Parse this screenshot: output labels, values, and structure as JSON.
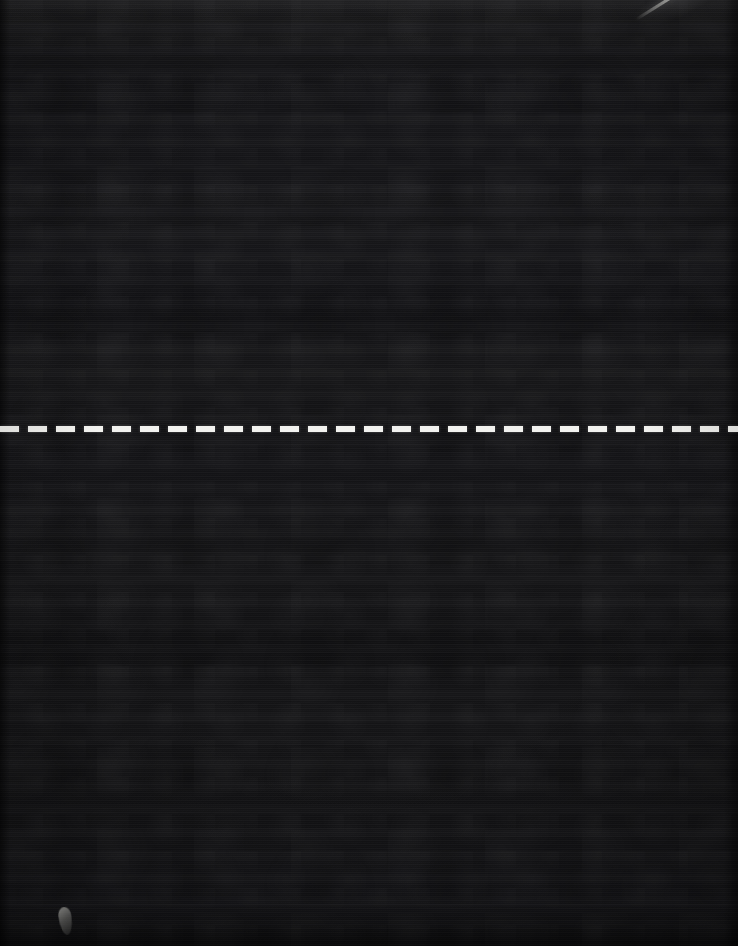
{
  "image": {
    "title": "Dark surface with white dashed horizontal line",
    "width": 738,
    "height": 946,
    "background_color": "#141416",
    "description": "Near-black textured photographic surface with faint horizontal scanline banding"
  },
  "surface": {
    "name": "dark-background",
    "base_color": "#141416",
    "highlight_color": "#1b1b1d",
    "shadow_color": "#0f0f11",
    "texture": "horizontal-scanline-grain"
  },
  "dashed_line": {
    "name": "white-dashed-line",
    "color": "#f2f2ef",
    "orientation": "horizontal",
    "y_position": 426,
    "thickness": 6,
    "dash_length": 19,
    "gap_length": 9,
    "dash_count": 26,
    "spans_full_width": true
  },
  "artifacts": {
    "streak": {
      "name": "diagonal-light-streak",
      "color": "#ffffff",
      "location": "top-right",
      "angle_degrees": -32,
      "length": 90
    },
    "speck": {
      "name": "light-speck",
      "color": "#bebeb9",
      "location": "bottom-left",
      "x": 59,
      "y": 907,
      "width": 13,
      "height": 28
    }
  }
}
